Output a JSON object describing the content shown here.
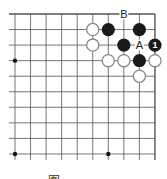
{
  "diagram": {
    "type": "go-board-fragment",
    "region": "top-right corner",
    "colors": {
      "background": "#ffffff",
      "line": "#555555",
      "black_stone": "#1a1a1a",
      "white_stone_fill": "#ffffff",
      "white_stone_stroke": "#888888",
      "label": "#222222",
      "number_on_black": "#ffffff"
    },
    "grid": {
      "columns": 10,
      "rows": 10,
      "origin_x": 15,
      "origin_y": 14,
      "spacing": 15.55,
      "top_edge_is_border": true,
      "right_edge_is_border": true,
      "left_edge_is_border": false,
      "bottom_edge_is_border": false
    },
    "star_points": [
      {
        "col": 0,
        "row": 3
      },
      {
        "col": 0,
        "row": 9
      },
      {
        "col": 6,
        "row": 9
      }
    ],
    "stones": [
      {
        "color": "white",
        "col": 5,
        "row": 1
      },
      {
        "color": "black",
        "col": 6,
        "row": 1
      },
      {
        "color": "black",
        "col": 8,
        "row": 1
      },
      {
        "color": "white",
        "col": 5,
        "row": 2
      },
      {
        "color": "black",
        "col": 7,
        "row": 2
      },
      {
        "color": "black",
        "col": 9,
        "row": 2,
        "number": "1"
      },
      {
        "color": "white",
        "col": 6,
        "row": 3
      },
      {
        "color": "white",
        "col": 7,
        "row": 3
      },
      {
        "color": "black",
        "col": 8,
        "row": 3
      },
      {
        "color": "white",
        "col": 9,
        "row": 3
      },
      {
        "color": "white",
        "col": 8,
        "row": 4
      }
    ],
    "labels": [
      {
        "text": "B",
        "col": 7,
        "row": 0
      },
      {
        "text": "A",
        "col": 8,
        "row": 2
      }
    ],
    "caption": "图"
  }
}
